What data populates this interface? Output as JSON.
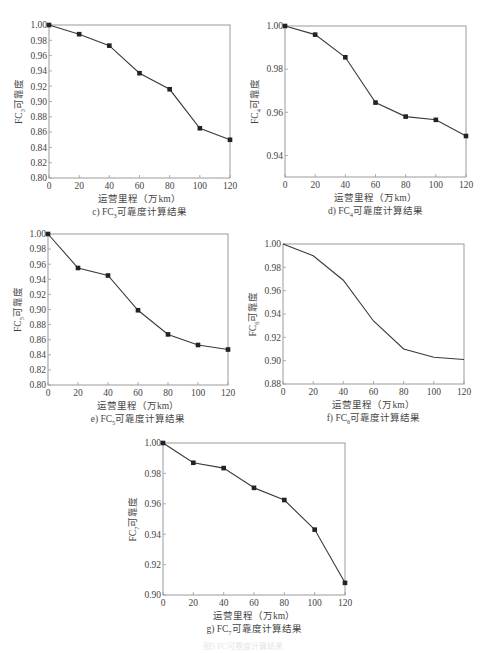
{
  "figure_caption": "图5  FC可靠度计算结果",
  "chart_data": [
    {
      "id": "c",
      "type": "line",
      "title": "c) FC3可靠度计算结果",
      "caption_prefix": "c) FC",
      "caption_sub": "3",
      "caption_suffix": "可靠度计算结果",
      "xlabel": "运营里程（万km）",
      "ylabel_prefix": "FC",
      "ylabel_sub": "3",
      "ylabel_suffix": "可靠度",
      "x": [
        0,
        20,
        40,
        60,
        80,
        100,
        120
      ],
      "series": [
        {
          "name": "FC3",
          "values": [
            1.0,
            0.988,
            0.973,
            0.937,
            0.916,
            0.865,
            0.85
          ],
          "markers": true
        }
      ],
      "xlim": [
        0,
        120
      ],
      "ylim": [
        0.8,
        1.0
      ],
      "xticks": [
        "0",
        "20",
        "40",
        "60",
        "80",
        "100",
        "120"
      ],
      "yticks": [
        "0.80",
        "0.82",
        "0.84",
        "0.86",
        "0.88",
        "0.90",
        "0.92",
        "0.94",
        "0.96",
        "0.98",
        "1.00"
      ],
      "grid": false
    },
    {
      "id": "d",
      "type": "line",
      "title": "d) FC4可靠度计算结果",
      "caption_prefix": "d) FC",
      "caption_sub": "4",
      "caption_suffix": "可靠度计算结果",
      "xlabel": "运营里程（万km）",
      "ylabel_prefix": "FC",
      "ylabel_sub": "4",
      "ylabel_suffix": "可靠度",
      "x": [
        0,
        20,
        40,
        60,
        80,
        100,
        120
      ],
      "series": [
        {
          "name": "FC4",
          "values": [
            1.0,
            0.996,
            0.9855,
            0.9645,
            0.958,
            0.9565,
            0.949
          ],
          "markers": true
        }
      ],
      "xlim": [
        0,
        120
      ],
      "ylim": [
        0.93,
        1.0
      ],
      "xticks": [
        "0",
        "20",
        "40",
        "60",
        "80",
        "100",
        "120"
      ],
      "yticks": [
        "0.94",
        "0.96",
        "0.98",
        "1.00"
      ],
      "ytick_values": [
        0.94,
        0.96,
        0.98,
        1.0
      ],
      "grid": false
    },
    {
      "id": "e",
      "type": "line",
      "title": "e) FC5可靠度计算结果",
      "caption_prefix": "e) FC",
      "caption_sub": "5",
      "caption_suffix": "可靠度计算结果",
      "xlabel": "运营里程（万km）",
      "ylabel_prefix": "FC",
      "ylabel_sub": "5",
      "ylabel_suffix": "可靠度",
      "x": [
        0,
        20,
        40,
        60,
        80,
        100,
        120
      ],
      "series": [
        {
          "name": "FC5",
          "values": [
            1.0,
            0.955,
            0.945,
            0.899,
            0.867,
            0.853,
            0.847
          ],
          "markers": true
        }
      ],
      "xlim": [
        0,
        120
      ],
      "ylim": [
        0.8,
        1.0
      ],
      "xticks": [
        "0",
        "20",
        "40",
        "60",
        "80",
        "100",
        "120"
      ],
      "yticks": [
        "0.80",
        "0.82",
        "0.84",
        "0.86",
        "0.88",
        "0.90",
        "0.92",
        "0.94",
        "0.96",
        "0.98",
        "1.00"
      ],
      "grid": false
    },
    {
      "id": "f",
      "type": "line",
      "title": "f) FC6可靠度计算结果",
      "caption_prefix": "f) FC",
      "caption_sub": "6",
      "caption_suffix": "可靠度计算结果",
      "xlabel": "运营里程（万km）",
      "ylabel_prefix": "FC",
      "ylabel_sub": "6",
      "ylabel_suffix": "可靠度",
      "x": [
        0,
        20,
        40,
        60,
        80,
        100,
        120
      ],
      "series": [
        {
          "name": "FC6",
          "values": [
            1.0,
            0.99,
            0.969,
            0.934,
            0.91,
            0.903,
            0.901
          ],
          "markers": false
        }
      ],
      "xlim": [
        0,
        120
      ],
      "ylim": [
        0.88,
        1.0
      ],
      "xticks": [
        "0",
        "20",
        "40",
        "60",
        "80",
        "100",
        "120"
      ],
      "yticks": [
        "0.88",
        "0.90",
        "0.92",
        "0.94",
        "0.96",
        "0.98",
        "1.00"
      ],
      "grid": false
    },
    {
      "id": "g",
      "type": "line",
      "title": "g) FC7可靠度计算结果",
      "caption_prefix": "g) FC",
      "caption_sub": "7",
      "caption_suffix": "可靠度计算结果",
      "xlabel": "运营里程（万km）",
      "ylabel_prefix": "FC",
      "ylabel_sub": "7",
      "ylabel_suffix": "可靠度",
      "x": [
        0,
        20,
        40,
        60,
        80,
        100,
        120
      ],
      "series": [
        {
          "name": "FC7",
          "values": [
            1.0,
            0.987,
            0.9835,
            0.9705,
            0.9625,
            0.943,
            0.908
          ],
          "markers": true
        }
      ],
      "xlim": [
        0,
        120
      ],
      "ylim": [
        0.9,
        1.0
      ],
      "xticks": [
        "0",
        "20",
        "40",
        "60",
        "80",
        "100",
        "120"
      ],
      "yticks": [
        "0.90",
        "0.92",
        "0.94",
        "0.96",
        "0.98",
        "1.00"
      ],
      "grid": false
    }
  ]
}
